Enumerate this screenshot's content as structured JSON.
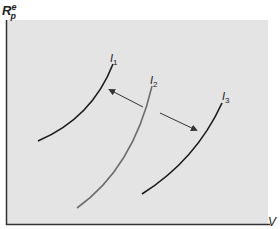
{
  "axes": {
    "y_label_main": "R",
    "y_label_sup": "e",
    "y_label_sub": "p",
    "x_label": "V"
  },
  "curves": [
    {
      "label": "I",
      "sub": "1",
      "color": "#1a1a1a"
    },
    {
      "label": "I",
      "sub": "2",
      "color": "#6e6e6e"
    },
    {
      "label": "I",
      "sub": "3",
      "color": "#1a1a1a"
    }
  ],
  "colors": {
    "panel": "#e4e4e4",
    "axis": "#333333",
    "arrow": "#333333"
  }
}
